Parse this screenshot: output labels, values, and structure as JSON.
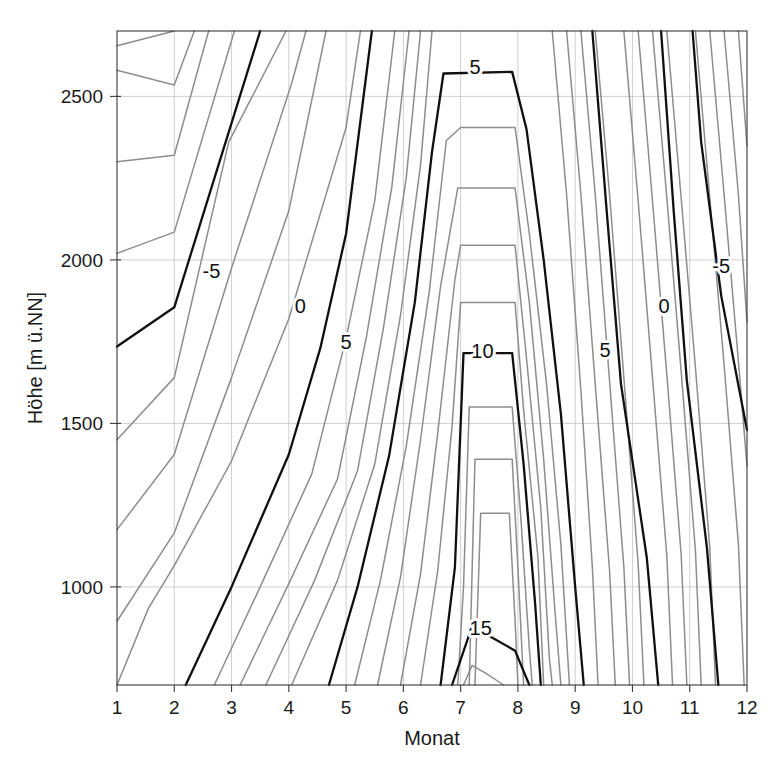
{
  "chart_data": {
    "type": "line",
    "subtype": "contour",
    "title": "",
    "xlabel": "Monat",
    "ylabel": "Höhe [m ü.NN]",
    "xlim": [
      1,
      12
    ],
    "ylim": [
      700,
      2700
    ],
    "xticks": [
      1,
      2,
      3,
      4,
      5,
      6,
      7,
      8,
      9,
      10,
      11,
      12
    ],
    "xticklabels": [
      "1",
      "2",
      "3",
      "4",
      "5",
      "6",
      "7",
      "8",
      "9",
      "10",
      "11",
      "12"
    ],
    "yticks": [
      1000,
      1500,
      2000,
      2500
    ],
    "yticklabels": [
      "1000",
      "1500",
      "2000",
      "2500"
    ],
    "grid": true,
    "legend": false,
    "colors": {
      "minor_contour": "#8d8d8d",
      "major_contour": "#101010",
      "gridline": "#c9c9c9",
      "axis": "#3a3a3a",
      "background": "#ffffff"
    },
    "contour_interval": 1,
    "major_contour_interval": 5,
    "variable": "Temperatur [°C]",
    "labeled_contours": [
      {
        "level": "-5",
        "x": 2.65,
        "y": 1960
      },
      {
        "level": "0",
        "x": 4.2,
        "y": 1855
      },
      {
        "level": "5",
        "x": 5.0,
        "y": 1745
      },
      {
        "level": "5",
        "x": 7.25,
        "y": 2585
      },
      {
        "level": "10",
        "x": 7.38,
        "y": 1715
      },
      {
        "level": "15",
        "x": 7.35,
        "y": 870
      },
      {
        "level": "5",
        "x": 9.52,
        "y": 1720
      },
      {
        "level": "0",
        "x": 10.55,
        "y": 1855
      },
      {
        "level": "-5",
        "x": 11.55,
        "y": 1975
      }
    ],
    "series": [
      {
        "name": "-9",
        "values": [
          [
            1,
            2655
          ],
          [
            2,
            2700
          ]
        ]
      },
      {
        "name": "-8",
        "values": [
          [
            1,
            2580
          ],
          [
            2,
            2535
          ],
          [
            2.35,
            2700
          ]
        ]
      },
      {
        "name": "-7",
        "values": [
          [
            1,
            2300
          ],
          [
            2,
            2320
          ],
          [
            2.6,
            2700
          ]
        ]
      },
      {
        "name": "-6",
        "values": [
          [
            1,
            2020
          ],
          [
            2,
            2085
          ],
          [
            3.05,
            2700
          ]
        ]
      },
      {
        "name": "-5",
        "values": [
          [
            1,
            1735
          ],
          [
            2,
            1855
          ],
          [
            3.5,
            2700
          ]
        ]
      },
      {
        "name": "-4",
        "values": [
          [
            1,
            1450
          ],
          [
            2,
            1640
          ],
          [
            2.95,
            2360
          ],
          [
            3.95,
            2700
          ]
        ]
      },
      {
        "name": "-3",
        "values": [
          [
            1,
            1175
          ],
          [
            2,
            1405
          ],
          [
            3,
            1975
          ],
          [
            4.05,
            2540
          ],
          [
            4.3,
            2700
          ]
        ]
      },
      {
        "name": "-2",
        "values": [
          [
            1,
            895
          ],
          [
            2,
            1165
          ],
          [
            3,
            1640
          ],
          [
            4,
            2150
          ],
          [
            4.65,
            2700
          ]
        ]
      },
      {
        "name": "-1",
        "values": [
          [
            1,
            700
          ],
          [
            1.55,
            935
          ],
          [
            2,
            1065
          ],
          [
            3,
            1385
          ],
          [
            4,
            1820
          ],
          [
            5,
            2405
          ],
          [
            5.25,
            2700
          ]
        ]
      },
      {
        "name": "0-left",
        "values": [
          [
            2.2,
            700
          ],
          [
            3,
            1000
          ],
          [
            4,
            1405
          ],
          [
            4.55,
            1730
          ],
          [
            5,
            2080
          ],
          [
            5.45,
            2700
          ]
        ]
      },
      {
        "name": "1",
        "values": [
          [
            2.7,
            700
          ],
          [
            3.5,
            1000
          ],
          [
            4.4,
            1345
          ],
          [
            5,
            1760
          ],
          [
            5.5,
            2180
          ],
          [
            5.85,
            2700
          ]
        ]
      },
      {
        "name": "2",
        "values": [
          [
            3.15,
            700
          ],
          [
            4,
            1010
          ],
          [
            4.85,
            1330
          ],
          [
            5.35,
            1760
          ],
          [
            5.8,
            2225
          ],
          [
            6.1,
            2700
          ]
        ]
      },
      {
        "name": "3",
        "values": [
          [
            3.6,
            700
          ],
          [
            4.45,
            1020
          ],
          [
            5.2,
            1355
          ],
          [
            5.65,
            1790
          ],
          [
            6.05,
            2250
          ],
          [
            6.3,
            2700
          ]
        ]
      },
      {
        "name": "4",
        "values": [
          [
            4.05,
            700
          ],
          [
            4.85,
            1020
          ],
          [
            5.5,
            1375
          ],
          [
            5.95,
            1830
          ],
          [
            6.3,
            2290
          ],
          [
            6.5,
            2700
          ]
        ]
      },
      {
        "name": "5-left",
        "values": [
          [
            4.7,
            700
          ],
          [
            5.2,
            1000
          ],
          [
            5.75,
            1400
          ],
          [
            6.2,
            1870
          ],
          [
            6.5,
            2330
          ],
          [
            6.7,
            2570
          ],
          [
            7.9,
            2575
          ],
          [
            8.15,
            2400
          ],
          [
            8.45,
            2000
          ],
          [
            8.75,
            1530
          ],
          [
            9.0,
            1000
          ],
          [
            9.15,
            700
          ]
        ]
      },
      {
        "name": "6",
        "values": [
          [
            5.15,
            700
          ],
          [
            5.6,
            1020
          ],
          [
            6.05,
            1430
          ],
          [
            6.45,
            1900
          ],
          [
            6.75,
            2365
          ],
          [
            7.0,
            2405
          ],
          [
            7.95,
            2405
          ],
          [
            8.2,
            2080
          ],
          [
            8.5,
            1620
          ],
          [
            8.75,
            1130
          ],
          [
            8.9,
            700
          ]
        ]
      },
      {
        "name": "7",
        "values": [
          [
            5.55,
            700
          ],
          [
            5.95,
            1030
          ],
          [
            6.3,
            1450
          ],
          [
            6.65,
            1920
          ],
          [
            6.95,
            2220
          ],
          [
            7.95,
            2220
          ],
          [
            8.2,
            1870
          ],
          [
            8.45,
            1390
          ],
          [
            8.65,
            920
          ],
          [
            8.75,
            700
          ]
        ]
      },
      {
        "name": "8",
        "values": [
          [
            5.95,
            700
          ],
          [
            6.3,
            1040
          ],
          [
            6.6,
            1470
          ],
          [
            6.9,
            1940
          ],
          [
            7.0,
            2045
          ],
          [
            7.95,
            2045
          ],
          [
            8.15,
            1700
          ],
          [
            8.4,
            1240
          ],
          [
            8.55,
            780
          ],
          [
            8.6,
            700
          ]
        ]
      },
      {
        "name": "9",
        "values": [
          [
            6.3,
            700
          ],
          [
            6.6,
            1050
          ],
          [
            6.85,
            1490
          ],
          [
            7.0,
            1870
          ],
          [
            7.95,
            1870
          ],
          [
            8.1,
            1540
          ],
          [
            8.35,
            1090
          ],
          [
            8.45,
            700
          ]
        ]
      },
      {
        "name": "10-mid",
        "values": [
          [
            6.65,
            700
          ],
          [
            6.9,
            1060
          ],
          [
            7.05,
            1715
          ],
          [
            7.9,
            1715
          ],
          [
            8.1,
            1375
          ],
          [
            8.3,
            950
          ],
          [
            8.4,
            700
          ]
        ]
      },
      {
        "name": "11",
        "values": [
          [
            6.95,
            700
          ],
          [
            7.05,
            1000
          ],
          [
            7.15,
            1550
          ],
          [
            7.9,
            1550
          ],
          [
            8.05,
            1215
          ],
          [
            8.2,
            810
          ],
          [
            8.25,
            700
          ]
        ]
      },
      {
        "name": "12",
        "values": [
          [
            7.15,
            700
          ],
          [
            7.25,
            1390
          ],
          [
            7.9,
            1390
          ],
          [
            8.0,
            1060
          ],
          [
            8.1,
            700
          ]
        ]
      },
      {
        "name": "13",
        "values": [
          [
            7.25,
            700
          ],
          [
            7.35,
            1225
          ],
          [
            7.85,
            1225
          ],
          [
            7.95,
            900
          ],
          [
            8.0,
            700
          ]
        ]
      },
      {
        "name": "14",
        "values": [
          [
            7.05,
            700
          ],
          [
            7.2,
            760
          ],
          [
            7.45,
            735
          ],
          [
            7.75,
            700
          ]
        ]
      },
      {
        "name": "15-mid",
        "values": [
          [
            6.85,
            700
          ],
          [
            7.2,
            880
          ],
          [
            7.95,
            805
          ],
          [
            8.2,
            700
          ]
        ]
      },
      {
        "name": "9r",
        "values": [
          [
            8.6,
            2700
          ],
          [
            8.85,
            2200
          ],
          [
            9.1,
            1600
          ],
          [
            9.3,
            1060
          ],
          [
            9.4,
            700
          ]
        ]
      },
      {
        "name": "8r",
        "values": [
          [
            8.85,
            2700
          ],
          [
            9.1,
            2200
          ],
          [
            9.35,
            1620
          ],
          [
            9.6,
            1050
          ],
          [
            9.7,
            700
          ]
        ]
      },
      {
        "name": "7r",
        "values": [
          [
            9.1,
            2700
          ],
          [
            9.35,
            2200
          ],
          [
            9.6,
            1630
          ],
          [
            9.85,
            1060
          ],
          [
            9.95,
            700
          ]
        ]
      },
      {
        "name": "6r",
        "values": [
          [
            9.35,
            2700
          ],
          [
            9.6,
            2200
          ],
          [
            9.85,
            1640
          ],
          [
            10.1,
            1070
          ],
          [
            10.2,
            700
          ]
        ]
      },
      {
        "name": "5-right",
        "values": [
          [
            9.3,
            2700
          ],
          [
            9.55,
            2150
          ],
          [
            9.8,
            1620
          ],
          [
            10.25,
            1090
          ],
          [
            10.45,
            700
          ]
        ]
      },
      {
        "name": "4r",
        "values": [
          [
            9.85,
            2700
          ],
          [
            10.1,
            2180
          ],
          [
            10.35,
            1640
          ],
          [
            10.6,
            1095
          ],
          [
            10.7,
            700
          ]
        ]
      },
      {
        "name": "3r",
        "values": [
          [
            10.1,
            2700
          ],
          [
            10.35,
            2180
          ],
          [
            10.6,
            1650
          ],
          [
            10.85,
            1100
          ],
          [
            10.95,
            700
          ]
        ]
      },
      {
        "name": "2r",
        "values": [
          [
            10.35,
            2700
          ],
          [
            10.6,
            2190
          ],
          [
            10.85,
            1660
          ],
          [
            11.1,
            1110
          ],
          [
            11.2,
            700
          ]
        ]
      },
      {
        "name": "1r",
        "values": [
          [
            10.6,
            2700
          ],
          [
            10.85,
            2190
          ],
          [
            11.1,
            1670
          ],
          [
            11.35,
            1120
          ],
          [
            11.45,
            700
          ]
        ]
      },
      {
        "name": "0-right",
        "values": [
          [
            10.5,
            2700
          ],
          [
            10.72,
            2150
          ],
          [
            10.95,
            1630
          ],
          [
            11.3,
            1120
          ],
          [
            11.5,
            700
          ]
        ]
      },
      {
        "name": "-1r",
        "values": [
          [
            11.1,
            2700
          ],
          [
            11.35,
            2190
          ],
          [
            11.6,
            1680
          ],
          [
            11.85,
            1130
          ],
          [
            11.95,
            700
          ]
        ]
      },
      {
        "name": "-2r",
        "values": [
          [
            11.35,
            2700
          ],
          [
            11.6,
            2200
          ],
          [
            11.85,
            1690
          ],
          [
            12,
            1370
          ]
        ]
      },
      {
        "name": "-3r",
        "values": [
          [
            11.6,
            2700
          ],
          [
            11.85,
            2200
          ],
          [
            12,
            1810
          ]
        ]
      },
      {
        "name": "-5-right",
        "values": [
          [
            11.05,
            2700
          ],
          [
            11.2,
            2360
          ],
          [
            11.55,
            1890
          ],
          [
            12,
            1480
          ]
        ]
      },
      {
        "name": "-4r",
        "values": [
          [
            11.85,
            2700
          ],
          [
            12,
            2350
          ]
        ]
      }
    ]
  }
}
